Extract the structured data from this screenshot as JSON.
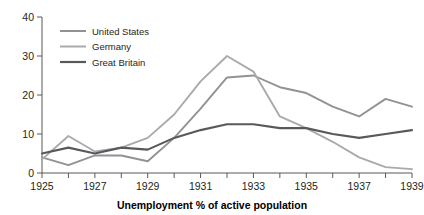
{
  "chart_data": {
    "type": "line",
    "title": "",
    "xlabel": "Unemployment % of active population",
    "ylabel": "",
    "xlim": [
      1925,
      1939
    ],
    "ylim": [
      0,
      40
    ],
    "yticks": [
      0,
      10,
      20,
      30,
      40
    ],
    "xticks": [
      1925,
      1926,
      1927,
      1928,
      1929,
      1930,
      1931,
      1932,
      1933,
      1934,
      1935,
      1936,
      1937,
      1938,
      1939
    ],
    "xtick_labels": [
      "1925",
      "",
      "1927",
      "",
      "1929",
      "",
      "1931",
      "",
      "1933",
      "",
      "1935",
      "",
      "1937",
      "",
      "1939"
    ],
    "grid": false,
    "legend_position": "top-left",
    "x": [
      1925,
      1926,
      1927,
      1928,
      1929,
      1930,
      1931,
      1932,
      1933,
      1934,
      1935,
      1936,
      1937,
      1938,
      1939
    ],
    "series": [
      {
        "name": "United States",
        "color": "#909295",
        "width": 1.9,
        "values": [
          4.0,
          2.0,
          4.5,
          4.5,
          3.0,
          9.0,
          16.5,
          24.5,
          25.0,
          22.0,
          20.5,
          17.0,
          14.5,
          19.0,
          17.0
        ]
      },
      {
        "name": "Germany",
        "color": "#a8aaad",
        "width": 1.9,
        "values": [
          3.5,
          9.5,
          5.5,
          6.5,
          9.0,
          15.0,
          23.5,
          30.0,
          26.0,
          14.5,
          11.5,
          8.0,
          4.0,
          1.5,
          1.0
        ]
      },
      {
        "name": "Great Britain",
        "color": "#58595b",
        "width": 2.1,
        "values": [
          5.0,
          6.5,
          5.0,
          6.5,
          6.0,
          9.0,
          11.0,
          12.5,
          12.5,
          11.5,
          11.5,
          10.0,
          9.0,
          10.0,
          11.0
        ]
      }
    ]
  },
  "legend": {
    "items": [
      {
        "label": "United States",
        "color": "#909295"
      },
      {
        "label": "Germany",
        "color": "#a8aaad"
      },
      {
        "label": "Great Britain",
        "color": "#58595b"
      }
    ]
  },
  "axis": {
    "x_title": "Unemployment % of active population"
  }
}
